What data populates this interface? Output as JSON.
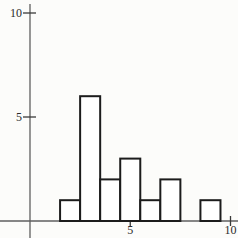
{
  "figure": {
    "background": "#fcfcfa",
    "colors": {
      "axis": "#5f5f5f",
      "tick": "#3a3a3a",
      "text": "#2b2b2b",
      "bar_stroke": "#1c1c1c",
      "bar_fill": "#ffffff"
    }
  },
  "chart_data": {
    "type": "bar",
    "title": "",
    "xlabel": "",
    "ylabel": "",
    "x": [
      2,
      3,
      4,
      5,
      6,
      7,
      8,
      9
    ],
    "values": [
      1,
      6,
      2,
      3,
      1,
      2,
      0,
      1
    ],
    "bar_width": 1,
    "xlim": [
      0,
      10.4
    ],
    "ylim": [
      0,
      10.4
    ],
    "grid": false,
    "legend": null,
    "x_ticks": [
      {
        "value": 5,
        "label": "5"
      },
      {
        "value": 10,
        "label": "10"
      }
    ],
    "y_ticks": [
      {
        "value": 5,
        "label": "5"
      },
      {
        "value": 10,
        "label": "10"
      }
    ]
  }
}
